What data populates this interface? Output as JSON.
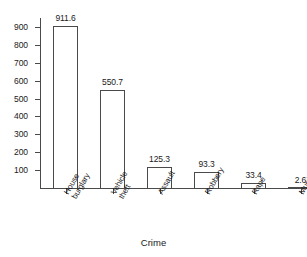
{
  "chart_data": {
    "type": "bar",
    "title": "",
    "xlabel": "Crime",
    "ylabel": "",
    "categories": [
      "House burglary",
      "Vehicle theft",
      "Assault",
      "Robbery",
      "Rape",
      "Murder"
    ],
    "category_lines": [
      [
        "House",
        "burglary"
      ],
      [
        "Vehicle",
        "theft"
      ],
      [
        "Assault",
        ""
      ],
      [
        "Robbery",
        ""
      ],
      [
        "Rape",
        ""
      ],
      [
        "Murder",
        ""
      ]
    ],
    "values": [
      911.6,
      550.7,
      125.3,
      93.3,
      33.4,
      2.6
    ],
    "value_labels": [
      "911.6",
      "550.7",
      "125.3",
      "93.3",
      "33.4",
      "2.6"
    ],
    "ylim": [
      0,
      950
    ],
    "yticks": [
      100,
      200,
      300,
      400,
      500,
      600,
      700,
      800,
      900
    ],
    "ytick_labels": [
      "100",
      "200",
      "300",
      "400",
      "500",
      "600",
      "700",
      "800",
      "900"
    ],
    "grid": false,
    "legend": null,
    "bar_fill": "#ffffff",
    "bar_edge": "#4a4a4a",
    "axis_color": "#4a4a4a",
    "text_color": "#1a1a1a",
    "background": "#ffffff"
  },
  "top_caption": ""
}
